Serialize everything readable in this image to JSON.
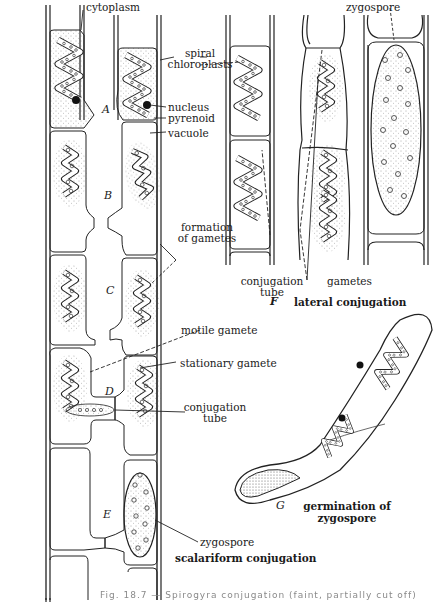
{
  "figure": {
    "panels": [
      {
        "id": "A",
        "label": "A"
      },
      {
        "id": "B",
        "label": "B"
      },
      {
        "id": "C",
        "label": "C"
      },
      {
        "id": "D",
        "label": "D"
      },
      {
        "id": "E",
        "label": "E"
      },
      {
        "id": "F",
        "label": "F"
      },
      {
        "id": "G",
        "label": "G"
      }
    ],
    "labels": {
      "cytoplasm": "cytoplasm",
      "spiral_chloroplasts_1": "spiral",
      "spiral_chloroplasts_2": "chloroplasts",
      "nucleus": "nucleus",
      "pyrenoid": "pyrenoid",
      "vacuole": "vacuole",
      "formation_of_gametes_1": "formation",
      "formation_of_gametes_2": "of gametes",
      "motile_gamete": "motile gamete",
      "stationary_gamete": "stationary gamete",
      "conjugation_tube_left_1": "conjugation",
      "conjugation_tube_left_2": "tube",
      "zygospore_left": "zygospore",
      "zygospore_top": "zygospore",
      "conjugation_tube_f_1": "conjugation",
      "conjugation_tube_f_2": "tube",
      "gametes": "gametes"
    },
    "titles": {
      "scalariform": "scalariform conjugation",
      "lateral": "lateral conjugation",
      "germination_1": "germination of",
      "germination_2": "zygospore"
    },
    "caption": "Fig. 18.7 — Spirogyra conjugation (faint, partially cut off)"
  }
}
